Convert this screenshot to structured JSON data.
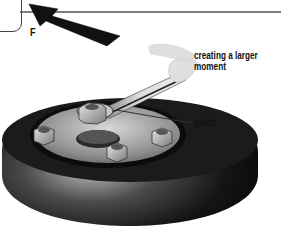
{
  "diagram": {
    "section_tab_letter": "t",
    "labels": {
      "force": "F",
      "moment": "creating a larger moment",
      "pivot": "pivot"
    },
    "elements": [
      "force-arrow",
      "spanner",
      "wheel-tyre",
      "wheel-hub",
      "wheel-nuts",
      "pivot-nut"
    ],
    "colors": {
      "tyre": "#1a1a1a",
      "hub": "#9a9a9a",
      "arrow": "#111111",
      "spanner": "#cfcfcf",
      "rule_line": "#555555"
    }
  }
}
